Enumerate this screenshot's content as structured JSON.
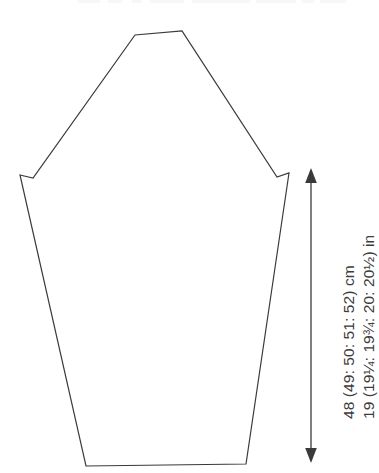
{
  "page": {
    "background_color": "#ffffff",
    "width": 379,
    "height": 473
  },
  "diagram": {
    "name": "garment-pattern-piece",
    "line_color": "#3a3a3a",
    "fill_color": "#ffffff",
    "stroke_width": 1.2,
    "outline_points": [
      [
        20,
        175
      ],
      [
        33,
        178
      ],
      [
        135,
        35
      ],
      [
        182,
        31
      ],
      [
        277,
        177
      ],
      [
        289,
        173
      ],
      [
        246,
        464
      ],
      [
        86,
        466
      ]
    ]
  },
  "dimension": {
    "name": "height-dimension-arrow",
    "arrow_color": "#3a3a3a",
    "arrow_x": 311,
    "arrow_top_y": 170,
    "arrow_bottom_y": 461,
    "labels": {
      "metric": "48 (49: 50: 51: 52) cm",
      "imperial": "19 (19¼: 19¾: 20: 20½) in"
    }
  },
  "cut_text_remnant": {
    "name": "cropped-text-remnant",
    "segments": [
      [
        78,
        22
      ],
      [
        108,
        14
      ],
      [
        132,
        10
      ],
      [
        150,
        34
      ],
      [
        192,
        58
      ],
      [
        256,
        40
      ],
      [
        302,
        12
      ],
      [
        320,
        26
      ]
    ]
  }
}
